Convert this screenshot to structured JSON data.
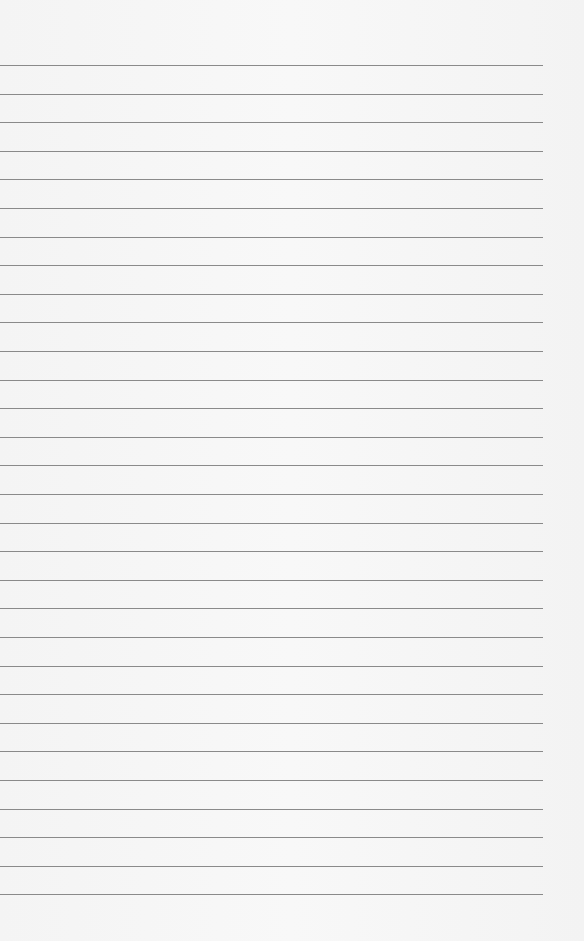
{
  "page": {
    "type": "lined-paper",
    "line_count": 30,
    "first_line_y": 65,
    "line_spacing": 28.6,
    "line_width": 543,
    "line_color": "#8a8a8a",
    "background": "#f6f6f6"
  }
}
